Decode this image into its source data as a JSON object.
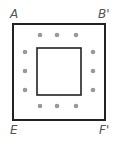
{
  "diagram": {
    "type": "nested-squares-with-dots",
    "labels": {
      "top_left": "A",
      "top_right": "B'",
      "bottom_left": "E",
      "bottom_right": "F'"
    },
    "outer_square": {
      "x": 13,
      "y": 24,
      "width": 92,
      "height": 96,
      "stroke": "#222222"
    },
    "inner_square": {
      "x": 37,
      "y": 48,
      "width": 44,
      "height": 47,
      "stroke": "#222222"
    },
    "dot_color": "#999999",
    "dots": {
      "top": [
        [
          40,
          35
        ],
        [
          57,
          35
        ],
        [
          76,
          35
        ]
      ],
      "bottom": [
        [
          40,
          106
        ],
        [
          57,
          106
        ],
        [
          76,
          106
        ]
      ],
      "left": [
        [
          25,
          52
        ],
        [
          25,
          71
        ],
        [
          25,
          90
        ]
      ],
      "right": [
        [
          93,
          52
        ],
        [
          93,
          71
        ],
        [
          93,
          90
        ]
      ]
    }
  }
}
